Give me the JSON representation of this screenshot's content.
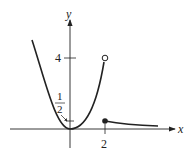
{
  "figure": {
    "axes": {
      "x_label": "x",
      "y_label": "y",
      "x_ticks": [
        {
          "value": 2,
          "label": "2"
        }
      ],
      "y_ticks": [
        {
          "value": 4,
          "label": "4"
        }
      ]
    },
    "annotations": [
      {
        "text_num": "1",
        "text_den": "2",
        "meaning": "fraction 1/2 with arrow pointing to y-axis tick near origin"
      }
    ],
    "points": {
      "open_circle": {
        "x": 2,
        "y": 4
      },
      "closed_dot": {
        "x": 2,
        "y": 0.5
      }
    },
    "colors": {
      "ink": "#222222",
      "background": "#ffffff"
    }
  }
}
